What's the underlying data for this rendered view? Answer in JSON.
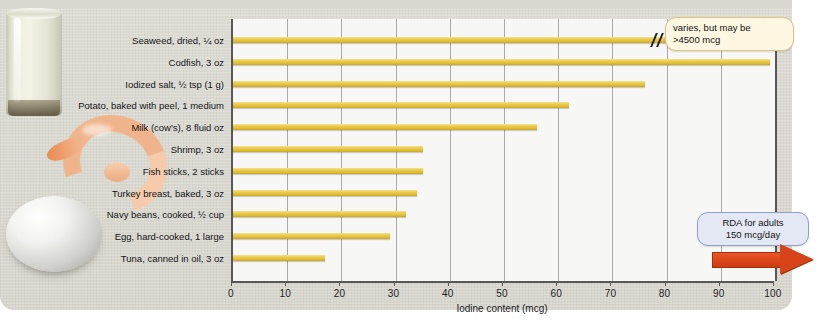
{
  "chart_data": {
    "type": "bar",
    "title": "",
    "xlabel": "Iodine content (mcg)",
    "ylabel": "",
    "xlim": [
      0,
      100
    ],
    "xticks": [
      0,
      10,
      20,
      30,
      40,
      50,
      60,
      70,
      80,
      90,
      100
    ],
    "grid": true,
    "orientation": "horizontal",
    "categories": [
      "Seaweed, dried, ¼ oz",
      "Codfish, 3 oz",
      "Iodized salt, ½ tsp (1 g)",
      "Potato, baked with peel, 1 medium",
      "Milk (cow's), 8 fluid oz",
      "Shrimp, 3 oz",
      "Fish sticks, 2 sticks",
      "Turkey breast, baked, 3 oz",
      "Navy beans, cooked, ½ cup",
      "Egg, hard-cooked, 1 large",
      "Tuna, canned in oil, 3 oz"
    ],
    "values": [
      4500,
      99,
      76,
      62,
      56,
      35,
      35,
      34,
      32,
      29,
      17
    ],
    "bar_color": "#e9cf52",
    "notes": [
      "Seaweed bar is axis-broken (// mark) because its value exceeds the 0-100 scale"
    ],
    "annotations": [
      {
        "name": "varies-callout",
        "line1": "varies, but may be",
        "line2": ">4500 mcg",
        "target_category": "Seaweed, dried, ¼ oz",
        "box_color": "#fdf6e0",
        "border_color": "#d9c489"
      },
      {
        "name": "rda-callout",
        "line1": "RDA for adults",
        "line2": "150 mcg/day",
        "box_color": "#e3e8f4",
        "border_color": "#8fa0c7",
        "arrow_color": "#d8441a",
        "arrow_direction": "right"
      }
    ]
  },
  "photos": [
    {
      "name": "milk-glass-photo",
      "alt": "glass of milk"
    },
    {
      "name": "shrimp-photo",
      "alt": "cooked shrimp"
    },
    {
      "name": "egg-photo",
      "alt": "hard-cooked egg"
    }
  ]
}
